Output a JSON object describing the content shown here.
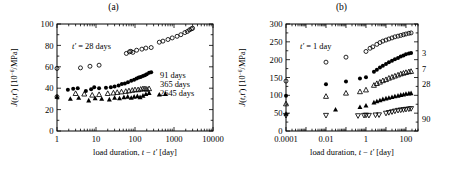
{
  "figure": {
    "panels": [
      {
        "id": "a",
        "title": "(a)",
        "annotation": "t' = 28 days",
        "annotation_prefix": "t",
        "annotation_rest": " = 28 days",
        "xlabel_prefix": "load duration, ",
        "xlabel_math": "t − t'",
        "xlabel_suffix": " [day]",
        "ylabel_math": "J(t,t')",
        "ylabel_units": " [10",
        "ylabel_exp": "−6",
        "ylabel_units2": "/MPa]",
        "xticks": [
          "1",
          "10",
          "100",
          "1000",
          "10000"
        ],
        "yticks": [
          "0",
          "20",
          "40",
          "60",
          "80",
          "100"
        ],
        "legend": [
          "91 days",
          "365 days",
          "2645 days"
        ]
      },
      {
        "id": "b",
        "title": "(b)",
        "annotation": "t' = 1 day",
        "annotation_prefix": "t",
        "annotation_rest": " = 1 day",
        "xlabel_prefix": "load duration, ",
        "xlabel_math": "t − t'",
        "xlabel_suffix": " [day]",
        "ylabel_math": "J(t,t')",
        "ylabel_units": " [10",
        "ylabel_exp": "−6",
        "ylabel_units2": "/MPa]",
        "xticks": [
          "0.0001",
          "0.01",
          "1",
          "100"
        ],
        "yticks": [
          "0",
          "50",
          "100",
          "150",
          "200",
          "250",
          "300"
        ],
        "series_labels": [
          "3",
          "7",
          "28",
          "90"
        ]
      }
    ]
  },
  "chart_data": [
    {
      "type": "scatter",
      "panel": "a",
      "title": "(a)",
      "xlabel": "load duration, t − t' [day]",
      "ylabel": "J(t,t') [10−6/MPa]",
      "xscale": "log",
      "xlim": [
        1,
        10000
      ],
      "ylim": [
        0,
        100
      ],
      "xticks": [
        1,
        10,
        100,
        1000,
        10000
      ],
      "yticks": [
        0,
        20,
        40,
        60,
        80,
        100
      ],
      "grid": false,
      "annotations": [
        "t' = 28 days"
      ],
      "legend_position": "right-inside",
      "series": [
        {
          "name": "91 days",
          "marker": "open-circle",
          "points": [
            [
              1.0,
              58.5
            ],
            [
              1.0,
              32.0
            ],
            [
              4.0,
              59.0
            ],
            [
              7.0,
              60.5
            ],
            [
              12.0,
              61.5
            ],
            [
              60.0,
              72.5
            ],
            [
              72.0,
              74.0
            ],
            [
              78.0,
              74.5
            ],
            [
              88.0,
              73.5
            ],
            [
              110.0,
              75.5
            ],
            [
              150.0,
              76.5
            ],
            [
              190.0,
              77.5
            ],
            [
              260.0,
              78.0
            ],
            [
              420.0,
              83.0
            ],
            [
              520.0,
              84.0
            ],
            [
              700.0,
              85.5
            ],
            [
              900.0,
              87.0
            ],
            [
              1200.0,
              88.5
            ],
            [
              1500.0,
              90.0
            ],
            [
              1900.0,
              92.0
            ],
            [
              2200.0,
              93.0
            ],
            [
              2500.0,
              94.5
            ],
            [
              2800.0,
              95.5
            ],
            [
              3000.0,
              96.0
            ]
          ]
        },
        {
          "name": "365 days",
          "marker": "filled-circle",
          "points": [
            [
              1.9,
              38.5
            ],
            [
              2.6,
              39.5
            ],
            [
              3.4,
              40.0
            ],
            [
              5.5,
              37.5
            ],
            [
              7.5,
              39.0
            ],
            [
              9.0,
              41.0
            ],
            [
              12.0,
              40.0
            ],
            [
              18.0,
              40.5
            ],
            [
              24.0,
              41.0
            ],
            [
              30.0,
              41.5
            ],
            [
              38.0,
              42.5
            ],
            [
              46.0,
              44.0
            ],
            [
              55.0,
              44.5
            ],
            [
              66.0,
              45.5
            ],
            [
              80.0,
              47.0
            ],
            [
              95.0,
              48.0
            ],
            [
              110.0,
              49.0
            ],
            [
              125.0,
              50.0
            ],
            [
              140.0,
              50.5
            ],
            [
              160.0,
              51.5
            ],
            [
              180.0,
              52.0
            ],
            [
              200.0,
              53.0
            ],
            [
              230.0,
              54.5
            ],
            [
              260.0,
              55.0
            ]
          ]
        },
        {
          "name": "2645 days",
          "marker": "open-triangle",
          "points": [
            [
              3.0,
              35.0
            ],
            [
              5.0,
              34.5
            ],
            [
              8.0,
              33.5
            ],
            [
              12.0,
              34.0
            ],
            [
              20.0,
              35.0
            ],
            [
              28.0,
              35.5
            ],
            [
              35.0,
              36.0
            ],
            [
              45.0,
              36.5
            ],
            [
              58.0,
              37.0
            ],
            [
              70.0,
              37.5
            ],
            [
              85.0,
              38.0
            ],
            [
              100.0,
              38.5
            ],
            [
              120.0,
              38.5
            ],
            [
              140.0,
              39.0
            ],
            [
              160.0,
              39.5
            ],
            [
              180.0,
              39.5
            ],
            [
              200.0,
              39.0
            ],
            [
              230.0,
              39.5
            ]
          ]
        },
        {
          "name": "2645 days",
          "marker": "filled-triangle",
          "points": [
            [
              1.0,
              32.0
            ],
            [
              2.2,
              30.0
            ],
            [
              3.6,
              31.0
            ],
            [
              6.5,
              28.5
            ],
            [
              9.5,
              30.5
            ],
            [
              14.0,
              30.0
            ],
            [
              22.0,
              29.5
            ],
            [
              30.0,
              31.0
            ],
            [
              40.0,
              30.5
            ],
            [
              52.0,
              31.5
            ],
            [
              65.0,
              32.0
            ],
            [
              80.0,
              31.0
            ],
            [
              95.0,
              32.0
            ],
            [
              115.0,
              32.5
            ],
            [
              135.0,
              31.5
            ],
            [
              160.0,
              33.0
            ],
            [
              190.0,
              34.5
            ],
            [
              230.0,
              35.5
            ],
            [
              420.0,
              34.0
            ],
            [
              600.0,
              34.5
            ]
          ]
        }
      ]
    },
    {
      "type": "scatter",
      "panel": "b",
      "title": "(b)",
      "xlabel": "load duration, t − t' [day]",
      "ylabel": "J(t,t') [10−6/MPa]",
      "xscale": "log",
      "xlim": [
        0.0001,
        400
      ],
      "ylim": [
        0,
        300
      ],
      "xticks": [
        0.0001,
        0.01,
        1,
        100
      ],
      "yticks": [
        0,
        50,
        100,
        150,
        200,
        250,
        300
      ],
      "grid": false,
      "annotations": [
        "t' = 1 day"
      ],
      "legend_position": "right-outside",
      "series": [
        {
          "name": "1",
          "label": "1",
          "marker": "open-circle",
          "points": [
            [
              0.0001,
              140.0
            ],
            [
              0.01,
              193.0
            ],
            [
              0.1,
              207.0
            ],
            [
              1.0,
              223.0
            ],
            [
              1.6,
              232.0
            ],
            [
              2.2,
              236.0
            ],
            [
              3.5,
              243.0
            ],
            [
              5.0,
              248.0
            ],
            [
              7.0,
              252.0
            ],
            [
              10.0,
              255.0
            ],
            [
              14.0,
              258.0
            ],
            [
              20.0,
              261.0
            ],
            [
              28.0,
              264.0
            ],
            [
              40.0,
              266.0
            ],
            [
              55.0,
              268.0
            ],
            [
              75.0,
              270.0
            ],
            [
              100.0,
              272.0
            ],
            [
              140.0,
              274.0
            ],
            [
              180.0,
              275.0
            ]
          ]
        },
        {
          "name": "3",
          "label": "3",
          "marker": "filled-circle",
          "points": [
            [
              0.0001,
              99.0
            ],
            [
              0.01,
              131.0
            ],
            [
              0.1,
              139.0
            ],
            [
              0.5,
              147.0
            ],
            [
              1.0,
              151.0
            ],
            [
              2.5,
              166.0
            ],
            [
              3.5,
              172.0
            ],
            [
              5.0,
              178.0
            ],
            [
              7.0,
              183.0
            ],
            [
              10.0,
              188.0
            ],
            [
              14.0,
              193.0
            ],
            [
              20.0,
              197.0
            ],
            [
              28.0,
              201.0
            ],
            [
              40.0,
              205.0
            ],
            [
              55.0,
              209.0
            ],
            [
              75.0,
              212.0
            ],
            [
              100.0,
              215.0
            ],
            [
              140.0,
              217.0
            ],
            [
              180.0,
              219.0
            ]
          ]
        },
        {
          "name": "7",
          "label": "7",
          "marker": "open-triangle",
          "points": [
            [
              0.0001,
              76.0
            ],
            [
              0.01,
              97.0
            ],
            [
              0.1,
              106.0
            ],
            [
              0.5,
              110.0
            ],
            [
              1.0,
              115.0
            ],
            [
              2.5,
              128.0
            ],
            [
              3.5,
              133.0
            ],
            [
              5.0,
              137.0
            ],
            [
              7.0,
              141.0
            ],
            [
              10.0,
              144.0
            ],
            [
              14.0,
              148.0
            ],
            [
              20.0,
              151.0
            ],
            [
              28.0,
              154.0
            ],
            [
              40.0,
              157.0
            ],
            [
              55.0,
              160.0
            ],
            [
              75.0,
              162.0
            ],
            [
              100.0,
              164.0
            ],
            [
              140.0,
              166.0
            ],
            [
              180.0,
              167.0
            ]
          ]
        },
        {
          "name": "28",
          "label": "28",
          "marker": "filled-triangle",
          "points": [
            [
              0.0001,
              48.0
            ],
            [
              0.03,
              60.0
            ],
            [
              0.5,
              67.0
            ],
            [
              1.0,
              71.0
            ],
            [
              2.5,
              80.0
            ],
            [
              3.5,
              83.0
            ],
            [
              5.0,
              86.0
            ],
            [
              7.0,
              89.0
            ],
            [
              10.0,
              91.0
            ],
            [
              14.0,
              93.0
            ],
            [
              20.0,
              95.0
            ],
            [
              28.0,
              97.0
            ],
            [
              40.0,
              99.0
            ],
            [
              55.0,
              101.0
            ],
            [
              75.0,
              102.0
            ],
            [
              100.0,
              104.0
            ],
            [
              140.0,
              105.0
            ],
            [
              180.0,
              106.0
            ]
          ]
        },
        {
          "name": "90",
          "label": "90",
          "marker": "open-down-triangle",
          "points": [
            [
              0.0001,
              44.0
            ],
            [
              0.01,
              44.0
            ],
            [
              0.4,
              43.0
            ],
            [
              0.8,
              44.0
            ],
            [
              1.0,
              44.5
            ],
            [
              1.4,
              44.0
            ],
            [
              3.0,
              45.0
            ],
            [
              4.5,
              45.5
            ],
            [
              10.0,
              50.0
            ],
            [
              14.0,
              52.0
            ],
            [
              20.0,
              54.0
            ],
            [
              28.0,
              56.0
            ],
            [
              40.0,
              58.0
            ],
            [
              55.0,
              59.0
            ],
            [
              75.0,
              60.0
            ],
            [
              100.0,
              61.0
            ],
            [
              140.0,
              62.0
            ],
            [
              180.0,
              63.0
            ]
          ]
        }
      ]
    }
  ]
}
